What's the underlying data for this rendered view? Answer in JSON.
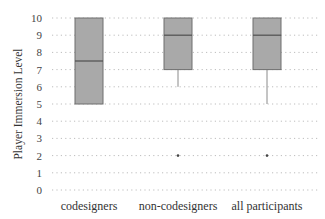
{
  "chart_data": {
    "type": "box",
    "title": "",
    "xlabel": "",
    "ylabel": "Player Immersion Level",
    "ylim": [
      0,
      10
    ],
    "yticks": [
      0,
      1,
      2,
      3,
      4,
      5,
      6,
      7,
      8,
      9,
      10
    ],
    "grid": "horizontal dotted",
    "legend": null,
    "categories": [
      "codesigners",
      "non-codesigners",
      "all participants"
    ],
    "boxes": [
      {
        "name": "codesigners",
        "whisker_low": 5,
        "q1": 5,
        "median": 7.5,
        "q3": 10,
        "whisker_high": 10,
        "outliers": []
      },
      {
        "name": "non-codesigners",
        "whisker_low": 6,
        "q1": 7,
        "median": 9,
        "q3": 10,
        "whisker_high": 10,
        "outliers": [
          2
        ]
      },
      {
        "name": "all participants",
        "whisker_low": 5,
        "q1": 7,
        "median": 9,
        "q3": 10,
        "whisker_high": 10,
        "outliers": [
          2
        ]
      }
    ],
    "colors": {
      "box_fill": "#a9a9a9",
      "box_stroke": "#6e6e6e",
      "median": "#555555",
      "grid": "#bdbdbd",
      "outlier": "#444444"
    }
  }
}
